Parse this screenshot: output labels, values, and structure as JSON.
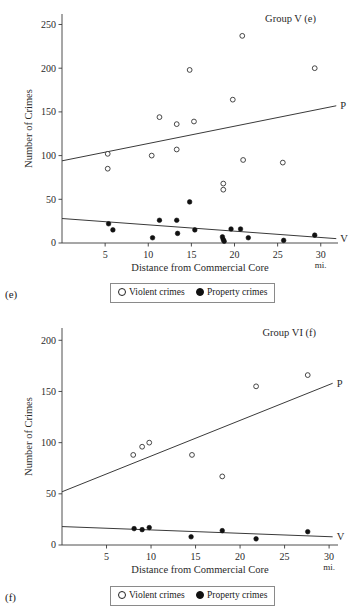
{
  "figure": {
    "panels": [
      {
        "panel_letter": "(e)",
        "title": "Group V (e)",
        "legend": {
          "violent_label": "Violent crimes",
          "property_label": "Property crimes",
          "violent_icon": "open-circle-marker",
          "property_icon": "filled-circle-marker"
        },
        "chart_data": {
          "type": "scatter",
          "title": "Group V (e)",
          "xlabel": "Distance from Commercial Core",
          "ylabel": "Number of Crimes",
          "xunit": "mi.",
          "xlim": [
            0,
            32
          ],
          "ylim": [
            0,
            262
          ],
          "xticks": [
            5,
            10,
            15,
            20,
            25,
            30
          ],
          "yticks": [
            0,
            50,
            100,
            150,
            200,
            250
          ],
          "grid": false,
          "legend_position": "below-plot",
          "series": [
            {
              "name": "Violent crimes",
              "marker": "open-circle",
              "points": [
                [
                  5.3,
                  102
                ],
                [
                  5.3,
                  85
                ],
                [
                  10.4,
                  100
                ],
                [
                  11.3,
                  144
                ],
                [
                  13.3,
                  136
                ],
                [
                  13.3,
                  107
                ],
                [
                  14.8,
                  198
                ],
                [
                  15.3,
                  139
                ],
                [
                  18.7,
                  68
                ],
                [
                  18.7,
                  61
                ],
                [
                  19.8,
                  164
                ],
                [
                  20.9,
                  237
                ],
                [
                  21.0,
                  95
                ],
                [
                  25.6,
                  92
                ],
                [
                  29.3,
                  200
                ]
              ],
              "fit_line": {
                "label": "P",
                "x0": 0,
                "y0": 94,
                "x1": 31.8,
                "y1": 157
              }
            },
            {
              "name": "Property crimes",
              "marker": "filled-circle",
              "points": [
                [
                  5.4,
                  22
                ],
                [
                  5.9,
                  15
                ],
                [
                  10.5,
                  6
                ],
                [
                  11.3,
                  26
                ],
                [
                  13.3,
                  26
                ],
                [
                  13.4,
                  11
                ],
                [
                  14.8,
                  47
                ],
                [
                  15.4,
                  15
                ],
                [
                  18.6,
                  7
                ],
                [
                  18.7,
                  4
                ],
                [
                  18.8,
                  2
                ],
                [
                  19.6,
                  16
                ],
                [
                  20.7,
                  16
                ],
                [
                  21.6,
                  6
                ],
                [
                  25.7,
                  3
                ],
                [
                  29.3,
                  9
                ]
              ],
              "fit_line": {
                "label": "V",
                "x0": 0,
                "y0": 28,
                "x1": 31.8,
                "y1": 5
              }
            }
          ]
        }
      },
      {
        "panel_letter": "(f)",
        "title": "Group VI (f)",
        "legend": {
          "violent_label": "Violent crimes",
          "property_label": "Property crimes",
          "violent_icon": "open-circle-marker",
          "property_icon": "filled-circle-marker"
        },
        "chart_data": {
          "type": "scatter",
          "title": "Group VI (f)",
          "xlabel": "Distance from Commercial Core",
          "ylabel": "Number of Crimes",
          "xunit": "mi.",
          "xlim": [
            0,
            31
          ],
          "ylim": [
            0,
            212
          ],
          "xticks": [
            5,
            10,
            15,
            20,
            25,
            30
          ],
          "yticks": [
            0,
            50,
            100,
            150,
            200
          ],
          "grid": false,
          "legend_position": "below-plot",
          "series": [
            {
              "name": "Violent crimes",
              "marker": "open-circle",
              "points": [
                [
                  8.0,
                  88
                ],
                [
                  9.0,
                  96
                ],
                [
                  9.8,
                  100
                ],
                [
                  14.6,
                  88
                ],
                [
                  18.0,
                  67
                ],
                [
                  21.8,
                  155
                ],
                [
                  27.6,
                  166
                ]
              ],
              "fit_line": {
                "label": "P",
                "x0": 0,
                "y0": 52,
                "x1": 30.4,
                "y1": 158
              }
            },
            {
              "name": "Property crimes",
              "marker": "filled-circle",
              "points": [
                [
                  8.1,
                  16
                ],
                [
                  9.0,
                  15
                ],
                [
                  9.8,
                  17
                ],
                [
                  14.5,
                  8
                ],
                [
                  18.0,
                  14
                ],
                [
                  21.8,
                  6
                ],
                [
                  27.6,
                  13
                ]
              ],
              "fit_line": {
                "label": "V",
                "x0": 0,
                "y0": 18,
                "x1": 30.4,
                "y1": 8
              }
            }
          ]
        }
      }
    ]
  }
}
